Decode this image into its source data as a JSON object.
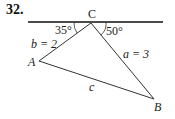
{
  "problem": {
    "number": "32."
  },
  "diagram": {
    "vertices": {
      "A": "A",
      "B": "B",
      "C": "C"
    },
    "sides": {
      "b": "b = 2",
      "a": "a = 3",
      "c": "c"
    },
    "angles": {
      "left": "35°",
      "right": "50°"
    },
    "colors": {
      "lines": "#333333",
      "baseline": "#111111"
    }
  }
}
